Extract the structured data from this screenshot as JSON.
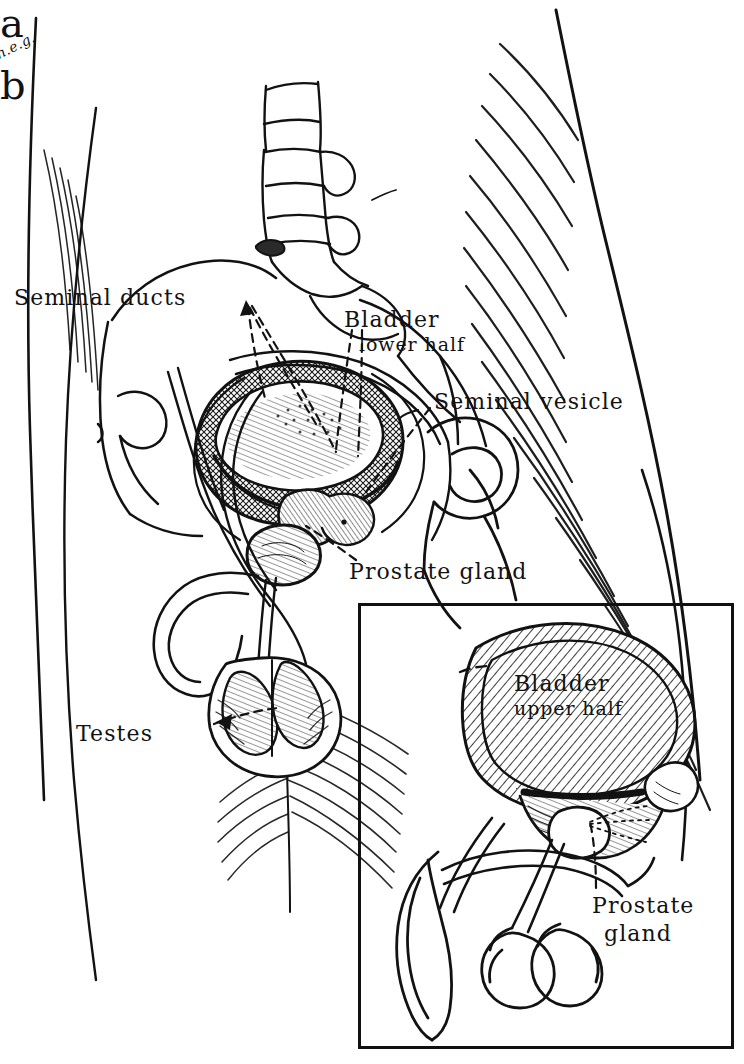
{
  "figure": {
    "panels": [
      {
        "id": "a",
        "mark": "a",
        "description": "Sagittal view of male pelvis showing bladder lower half, seminal vesicles, prostate and testes"
      },
      {
        "id": "b",
        "mark": "b",
        "description": "Inset detail showing bladder upper half, seminal ducts, prostate gland and testes isolated"
      }
    ],
    "ink_color": "#121212",
    "paper_color": "#ffffff"
  },
  "panel_a": {
    "mark": "a",
    "labels": {
      "seminal_ducts": "Seminal ducts",
      "bladder_line1": "Bladder",
      "bladder_line2": "lower half",
      "seminal_vesicle": "Seminal vesicle",
      "prostate_gland": "Prostate gland",
      "testes": "Testes"
    },
    "annotation": "n.e.g."
  },
  "panel_b": {
    "mark": "b",
    "labels": {
      "bladder_line1": "Bladder",
      "bladder_line2": "upper half",
      "prostate_line1": "Prostate",
      "prostate_line2": "gland"
    }
  }
}
